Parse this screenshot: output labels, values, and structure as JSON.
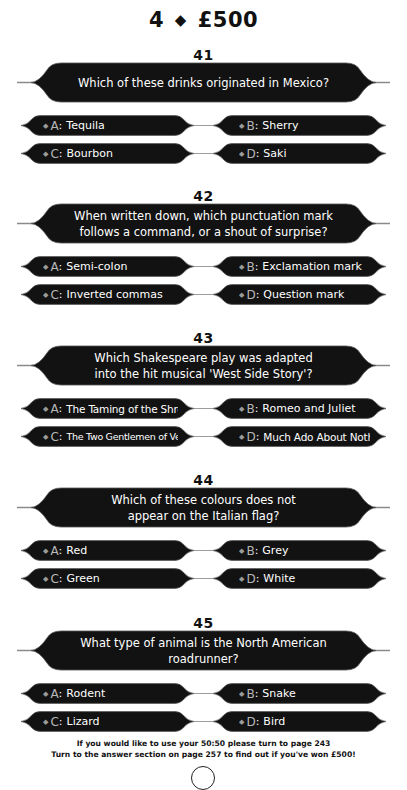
{
  "header": {
    "level": "4",
    "separator_icon": "◆",
    "prize": "£500"
  },
  "questions": [
    {
      "number": "41",
      "text": "Which of these drinks originated in Mexico?",
      "answers": [
        {
          "letter": "A",
          "text": "Tequila"
        },
        {
          "letter": "B",
          "text": "Sherry"
        },
        {
          "letter": "C",
          "text": "Bourbon"
        },
        {
          "letter": "D",
          "text": "Saki"
        }
      ]
    },
    {
      "number": "42",
      "text": "When written down, which punctuation mark\nfollows a command, or a shout of surprise?",
      "answers": [
        {
          "letter": "A",
          "text": "Semi-colon"
        },
        {
          "letter": "B",
          "text": "Exclamation mark"
        },
        {
          "letter": "C",
          "text": "Inverted commas"
        },
        {
          "letter": "D",
          "text": "Question mark"
        }
      ]
    },
    {
      "number": "43",
      "text": "Which Shakespeare play was adapted\ninto the hit musical 'West Side Story'?",
      "answers": [
        {
          "letter": "A",
          "text": "The Taming of the Shrew"
        },
        {
          "letter": "B",
          "text": "Romeo and Juliet"
        },
        {
          "letter": "C",
          "text": "The Two Gentlemen of Verona"
        },
        {
          "letter": "D",
          "text": "Much Ado About Nothing"
        }
      ]
    },
    {
      "number": "44",
      "text": "Which of these colours does not\nappear on the Italian flag?",
      "answers": [
        {
          "letter": "A",
          "text": "Red"
        },
        {
          "letter": "B",
          "text": "Grey"
        },
        {
          "letter": "C",
          "text": "Green"
        },
        {
          "letter": "D",
          "text": "White"
        }
      ]
    },
    {
      "number": "45",
      "text": "What type of animal is the North American roadrunner?",
      "answers": [
        {
          "letter": "A",
          "text": "Rodent"
        },
        {
          "letter": "B",
          "text": "Snake"
        },
        {
          "letter": "C",
          "text": "Lizard"
        },
        {
          "letter": "D",
          "text": "Bird"
        }
      ]
    }
  ],
  "footer": {
    "line1": "If you would like to use your 50:50 please turn to page 243",
    "line2": "Turn to the answer section on page 257 to find out if you've won £500!"
  },
  "colors": {
    "lozenge_fill": "#111111",
    "lozenge_text": "#ffffff",
    "letter_color": "#b8b8b8",
    "connector": "#9c9c9c"
  }
}
